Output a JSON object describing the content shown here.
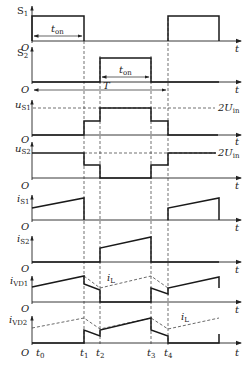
{
  "diagram": {
    "type": "timing-diagram",
    "axis_origin_label": "O",
    "time_axis_label": "t",
    "time_markers": [
      "t0",
      "t1",
      "t2",
      "t3",
      "t4"
    ],
    "period_label": "T",
    "on_time_label": "ton",
    "voltage_level_label": "2Uin",
    "inductor_current_label": "iL",
    "traces": [
      {
        "id": "S1",
        "label": "S1",
        "description": "gate signal of switch S1: high from t0 to t1 and again from t4"
      },
      {
        "id": "S2",
        "label": "S2",
        "description": "gate signal of switch S2: high from t2 to t3"
      },
      {
        "id": "uS1",
        "label": "uS1",
        "description": "voltage across S1: 0 until t1, step to mid level, 2Uin from t2 to t3, mid until t4, then 0"
      },
      {
        "id": "uS2",
        "label": "uS2",
        "description": "voltage across S2: 2Uin until t1, mid level to t2, 0 from t2 to t3, mid to t4, then 2Uin"
      },
      {
        "id": "iS1",
        "label": "iS1",
        "description": "S1 current ramps up during t0-t1 and after t4"
      },
      {
        "id": "iS2",
        "label": "iS2",
        "description": "S2 current ramps up during t2-t3"
      },
      {
        "id": "iVD1",
        "label": "iVD1",
        "description": "diode VD1 current with dashed iL reference"
      },
      {
        "id": "iVD2",
        "label": "iVD2",
        "description": "diode VD2 current with dashed iL reference"
      }
    ]
  },
  "labels": {
    "S1_main": "S",
    "S1_sub": "1",
    "S2_main": "S",
    "S2_sub": "2",
    "uS1_main": "u",
    "uS1_sub": "S1",
    "uS2_main": "u",
    "uS2_sub": "S2",
    "iS1_main": "i",
    "iS1_sub": "S1",
    "iS2_main": "i",
    "iS2_sub": "S2",
    "iVD1_main": "i",
    "iVD1_sub": "VD1",
    "iVD2_main": "i",
    "iVD2_sub": "VD2",
    "origin": "O",
    "t": "t",
    "ton_main": "t",
    "ton_sub": "on",
    "T": "T",
    "twoUin_main": "2U",
    "twoUin_sub": "in",
    "iL_main": "i",
    "iL_sub": "L",
    "t0_main": "t",
    "t0_sub": "0",
    "t1_main": "t",
    "t1_sub": "1",
    "t2_main": "t",
    "t2_sub": "2",
    "t3_main": "t",
    "t3_sub": "3",
    "t4_main": "t",
    "t4_sub": "4"
  }
}
